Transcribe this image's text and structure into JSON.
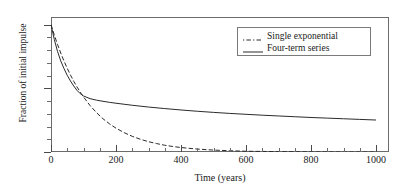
{
  "chart_data": {
    "type": "line",
    "title": "",
    "xlabel": "Time (years)",
    "ylabel": "Fraction of initial impulse",
    "xlim": [
      0,
      1040
    ],
    "ylim": [
      0,
      1.06
    ],
    "xticks": [
      0,
      200,
      400,
      600,
      800,
      1000
    ],
    "xticklabels": [
      "0",
      "200",
      "400",
      "600",
      "800",
      "1000"
    ],
    "yticks": [
      0,
      0.5,
      1.0
    ],
    "yticklabels": [
      "0",
      "0.5",
      "1.0"
    ],
    "x_minor_step": 50,
    "y_minor_step": 0.1,
    "grid": false,
    "legend_position": "upper right",
    "series": [
      {
        "name": "Single exponential",
        "style": "dash-dot",
        "x": [
          0,
          10,
          20,
          30,
          40,
          50,
          60,
          70,
          80,
          90,
          100,
          120,
          140,
          160,
          180,
          200,
          225,
          250,
          275,
          300,
          325,
          350,
          375,
          400,
          450,
          500,
          550,
          600,
          700,
          800,
          900,
          1000
        ],
        "y": [
          1.0,
          0.92,
          0.845,
          0.777,
          0.714,
          0.657,
          0.604,
          0.555,
          0.511,
          0.47,
          0.432,
          0.365,
          0.309,
          0.261,
          0.221,
          0.187,
          0.152,
          0.123,
          0.1,
          0.081,
          0.066,
          0.053,
          0.043,
          0.035,
          0.023,
          0.015,
          0.01,
          0.006,
          0.003,
          0.001,
          0.0,
          0.0
        ]
      },
      {
        "name": "Four-term series",
        "style": "solid",
        "x": [
          0,
          10,
          20,
          30,
          40,
          50,
          60,
          70,
          80,
          90,
          100,
          120,
          140,
          160,
          180,
          200,
          250,
          300,
          350,
          400,
          450,
          500,
          550,
          600,
          650,
          700,
          750,
          800,
          850,
          900,
          950,
          1000
        ],
        "y": [
          1.0,
          0.885,
          0.79,
          0.715,
          0.655,
          0.602,
          0.557,
          0.518,
          0.484,
          0.458,
          0.44,
          0.419,
          0.407,
          0.398,
          0.39,
          0.383,
          0.367,
          0.353,
          0.341,
          0.33,
          0.32,
          0.311,
          0.303,
          0.296,
          0.289,
          0.283,
          0.277,
          0.271,
          0.266,
          0.261,
          0.256,
          0.251
        ]
      }
    ],
    "annotations": []
  },
  "legend": {
    "entries": [
      {
        "label": "Single exponential",
        "style": "dash-dot"
      },
      {
        "label": "Four-term series",
        "style": "solid"
      }
    ]
  },
  "colors": {
    "line": "#2b2b2b",
    "frame": "#6b6b6b",
    "text": "#1a1a1a",
    "background": "#ffffff"
  }
}
